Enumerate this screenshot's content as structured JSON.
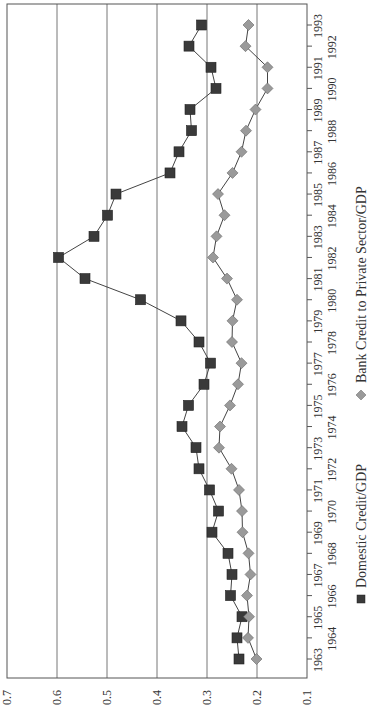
{
  "chart_data": {
    "type": "line",
    "orientation": "rotated-90-ccw",
    "title": "",
    "xlabel": "",
    "ylabel": "",
    "ylim": [
      0.1,
      0.7
    ],
    "yticks": [
      "0.1",
      "0.2",
      "0.3",
      "0.4",
      "0.5",
      "0.6",
      "0.7"
    ],
    "grid": true,
    "legend_position": "bottom",
    "categories": [
      "1963",
      "1964",
      "1965",
      "1966",
      "1967",
      "1968",
      "1969",
      "1970",
      "1971",
      "1972",
      "1973",
      "1974",
      "1975",
      "1976",
      "1977",
      "1978",
      "1979",
      "1980",
      "1981",
      "1982",
      "1983",
      "1984",
      "1985",
      "1986",
      "1987",
      "1988",
      "1989",
      "1990",
      "1991",
      "1992",
      "1993"
    ],
    "series": [
      {
        "name": "Domestic Credit/GDP",
        "marker": "square",
        "color": "#3a3a3a",
        "values": [
          0.236,
          0.24,
          0.23,
          0.253,
          0.25,
          0.258,
          0.29,
          0.277,
          0.295,
          0.316,
          0.322,
          0.35,
          0.337,
          0.306,
          0.293,
          0.316,
          0.352,
          0.433,
          0.544,
          0.597,
          0.526,
          0.499,
          0.482,
          0.374,
          0.356,
          0.331,
          0.334,
          0.282,
          0.292,
          0.336,
          0.311
        ]
      },
      {
        "name": "Bank Credit to Private Sector/GDP",
        "marker": "diamond",
        "color": "#9a9a9a",
        "values": [
          0.201,
          0.218,
          0.216,
          0.22,
          0.213,
          0.217,
          0.229,
          0.23,
          0.236,
          0.251,
          0.276,
          0.274,
          0.254,
          0.238,
          0.231,
          0.25,
          0.249,
          0.24,
          0.26,
          0.288,
          0.281,
          0.265,
          0.278,
          0.249,
          0.231,
          0.222,
          0.203,
          0.179,
          0.179,
          0.223,
          0.217
        ]
      }
    ]
  },
  "legend": {
    "items": [
      {
        "label": "Domestic Credit/GDP",
        "marker": "square"
      },
      {
        "label": "Bank Credit to Private Sector/GDP",
        "marker": "diamond"
      }
    ]
  }
}
